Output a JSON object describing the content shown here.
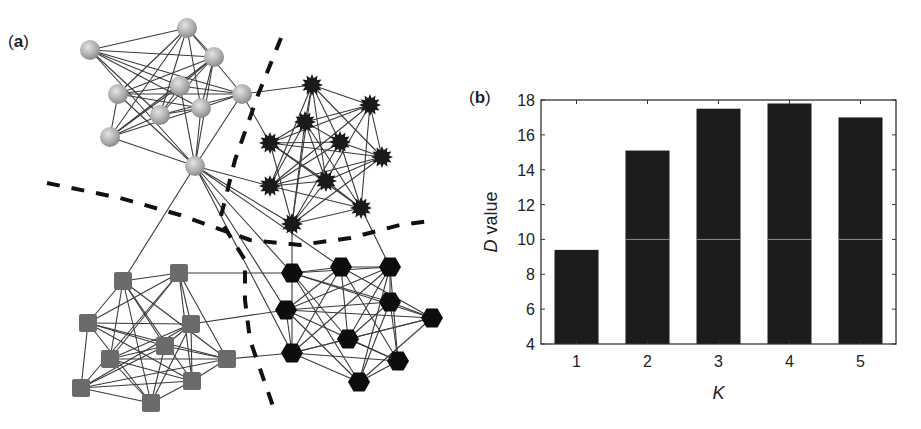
{
  "panels": {
    "a": {
      "label_open": "(",
      "label_letter": "a",
      "label_close": ")"
    },
    "b": {
      "label_open": "(",
      "label_letter": "b",
      "label_close": ")"
    }
  },
  "network": {
    "node_groups": [
      {
        "name": "spheres",
        "shape": "sphere",
        "color": "#b5b5b5",
        "nodes": [
          [
            90,
            50
          ],
          [
            187,
            28
          ],
          [
            214,
            57
          ],
          [
            118,
            94
          ],
          [
            180,
            86
          ],
          [
            242,
            94
          ],
          [
            160,
            115
          ],
          [
            201,
            108
          ],
          [
            110,
            137
          ],
          [
            195,
            166
          ]
        ]
      },
      {
        "name": "stars",
        "shape": "star",
        "color": "#1a1a1a",
        "nodes": [
          [
            312,
            85
          ],
          [
            370,
            105
          ],
          [
            305,
            122
          ],
          [
            270,
            143
          ],
          [
            340,
            142
          ],
          [
            382,
            157
          ],
          [
            270,
            186
          ],
          [
            326,
            181
          ],
          [
            361,
            208
          ],
          [
            292,
            224
          ]
        ]
      },
      {
        "name": "squares",
        "shape": "square",
        "color": "#6b6b6b",
        "nodes": [
          [
            123,
            281
          ],
          [
            179,
            273
          ],
          [
            88,
            323
          ],
          [
            191,
            324
          ],
          [
            165,
            346
          ],
          [
            110,
            359
          ],
          [
            227,
            359
          ],
          [
            192,
            381
          ],
          [
            81,
            388
          ],
          [
            151,
            403
          ]
        ]
      },
      {
        "name": "hexagons",
        "shape": "hexagon",
        "color": "#0d0d0d",
        "nodes": [
          [
            292,
            273
          ],
          [
            341,
            267
          ],
          [
            390,
            267
          ],
          [
            286,
            310
          ],
          [
            390,
            302
          ],
          [
            432,
            318
          ],
          [
            348,
            339
          ],
          [
            292,
            353
          ],
          [
            398,
            361
          ],
          [
            359,
            382
          ]
        ]
      }
    ],
    "inter_edges": [
      [
        [
          195,
          166
        ],
        [
          123,
          281
        ]
      ],
      [
        [
          195,
          166
        ],
        [
          292,
          224
        ]
      ],
      [
        [
          242,
          94
        ],
        [
          312,
          85
        ]
      ],
      [
        [
          195,
          166
        ],
        [
          270,
          186
        ]
      ],
      [
        [
          195,
          166
        ],
        [
          292,
          273
        ]
      ],
      [
        [
          195,
          166
        ],
        [
          286,
          310
        ]
      ],
      [
        [
          179,
          273
        ],
        [
          292,
          273
        ]
      ],
      [
        [
          191,
          324
        ],
        [
          286,
          310
        ]
      ],
      [
        [
          292,
          224
        ],
        [
          292,
          273
        ]
      ],
      [
        [
          361,
          208
        ],
        [
          390,
          267
        ]
      ],
      [
        [
          227,
          359
        ],
        [
          292,
          353
        ]
      ],
      [
        [
          195,
          166
        ],
        [
          292,
          353
        ]
      ],
      [
        [
          242,
          94
        ],
        [
          270,
          143
        ]
      ],
      [
        [
          195,
          166
        ],
        [
          341,
          267
        ]
      ]
    ],
    "dividers": [
      {
        "name": "horizontal-divider",
        "points": [
          [
            47,
            183
          ],
          [
            120,
            198
          ],
          [
            180,
            215
          ],
          [
            250,
            240
          ],
          [
            300,
            245
          ],
          [
            350,
            238
          ],
          [
            400,
            225
          ],
          [
            436,
            220
          ]
        ]
      },
      {
        "name": "vertical-divider",
        "points": [
          [
            281,
            38
          ],
          [
            258,
            95
          ],
          [
            235,
            160
          ],
          [
            220,
            220
          ],
          [
            245,
            260
          ],
          [
            245,
            300
          ],
          [
            250,
            340
          ],
          [
            275,
            412
          ]
        ]
      }
    ]
  },
  "chart_data": {
    "type": "bar",
    "title": "",
    "categories": [
      "1",
      "2",
      "3",
      "4",
      "5"
    ],
    "values": [
      9.4,
      15.1,
      17.5,
      17.8,
      17.0
    ],
    "xlabel": "K",
    "ylabel_italic": "D",
    "ylabel_rest": " value",
    "ylabel": "D value",
    "ylim": [
      4,
      18.5
    ],
    "yticks": [
      4,
      6,
      8,
      10,
      12,
      14,
      16,
      18
    ],
    "grid": false,
    "bar_color": "#1c1c1c",
    "reference_line": 10,
    "legend": null
  }
}
